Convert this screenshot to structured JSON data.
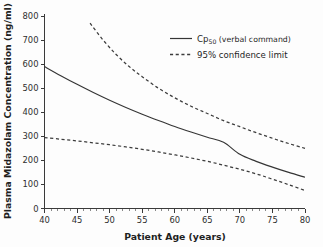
{
  "chart_data": {
    "type": "line",
    "title": "",
    "xlabel": "Patient Age (years)",
    "ylabel": "Plasma Midazolam Concentration (ng/ml)",
    "xlim": [
      40,
      80
    ],
    "ylim": [
      0,
      800
    ],
    "xticks": [
      40,
      45,
      50,
      55,
      60,
      65,
      70,
      75,
      80
    ],
    "yticks": [
      0,
      100,
      200,
      300,
      400,
      500,
      600,
      700,
      800
    ],
    "xtick_labels": [
      "40",
      "45",
      "50",
      "55",
      "60",
      "65",
      "70",
      "75",
      "80"
    ],
    "ytick_labels": [
      "0",
      "100",
      "200",
      "300",
      "400",
      "500",
      "600",
      "700",
      "800"
    ],
    "x_minor_step": 1,
    "grid": false,
    "legend_position": "top-right",
    "series": [
      {
        "name": "Cp50 (verbal command)",
        "style": "solid",
        "color": "#353535",
        "x": [
          40,
          42.5,
          45,
          47.5,
          50,
          52.5,
          55,
          57.5,
          60,
          62.5,
          65,
          67.5,
          70,
          72.5,
          75,
          77.5,
          80
        ],
        "values": [
          590,
          552,
          516,
          482,
          450,
          420,
          392,
          366,
          341,
          318,
          296,
          275,
          225,
          196,
          172,
          150,
          130
        ]
      },
      {
        "name": "95% confidence limit (upper)",
        "style": "dashed",
        "color": "#3c3c3c",
        "x": [
          47,
          49,
          51,
          53,
          55,
          57.5,
          60,
          62.5,
          65,
          67.5,
          70,
          72.5,
          75,
          77.5,
          80
        ],
        "values": [
          770,
          700,
          640,
          590,
          548,
          500,
          460,
          425,
          395,
          365,
          340,
          315,
          292,
          270,
          250
        ]
      },
      {
        "name": "95% confidence limit (lower)",
        "style": "dashed",
        "color": "#3c3c3c",
        "x": [
          40,
          42.5,
          45,
          47.5,
          50,
          52.5,
          55,
          57.5,
          60,
          62.5,
          65,
          67.5,
          70,
          72.5,
          75,
          77.5,
          80
        ],
        "values": [
          295,
          288,
          281,
          273,
          265,
          256,
          246,
          235,
          223,
          210,
          196,
          180,
          163,
          144,
          122,
          99,
          75
        ]
      }
    ],
    "legend": [
      {
        "label_main": "Cp",
        "label_sub": "50",
        "label_rest": " (verbal command)",
        "full_label": "Cp50 (verbal command)",
        "style": "solid"
      },
      {
        "label_main": "95% confidence limit",
        "label_sub": "",
        "label_rest": "",
        "full_label": "95% confidence limit",
        "style": "dashed"
      }
    ]
  },
  "colors": {
    "background": "#fdfdfd",
    "axis": "#3a3a3a",
    "text": "#1f1f1f",
    "curve": "#353535"
  }
}
